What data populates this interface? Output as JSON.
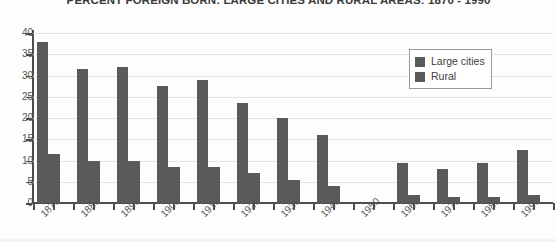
{
  "chart_data": {
    "type": "bar",
    "title": "PERCENT FOREIGN BORN: LARGE CITIES AND RURAL AREAS: 1870 - 1990",
    "xlabel": "",
    "ylabel": "",
    "ylim": [
      0,
      40
    ],
    "yticks": [
      0,
      5,
      10,
      15,
      20,
      25,
      30,
      35,
      40
    ],
    "ytick_labels": [
      "0",
      "5",
      "10",
      "15",
      "20",
      "25",
      "30",
      "35",
      "40"
    ],
    "grid": true,
    "legend_position": "upper-right",
    "categories": [
      "1870",
      "1880",
      "1890",
      "1900",
      "1910",
      "1920",
      "1930",
      "1940",
      "1950",
      "1960",
      "1970",
      "1980",
      "1990"
    ],
    "series": [
      {
        "name": "Large cities",
        "color": "#5a5a5a",
        "values": [
          38,
          31.5,
          32,
          27.5,
          29,
          23.5,
          20,
          16,
          null,
          9.5,
          8,
          9.5,
          12.5
        ]
      },
      {
        "name": "Rural",
        "color": "#5a5a5a",
        "values": [
          11.5,
          10,
          10,
          8.5,
          8.5,
          7,
          5.5,
          4,
          null,
          2,
          1.5,
          1.5,
          2
        ]
      }
    ]
  },
  "legend": {
    "items": [
      {
        "label": "Large cities",
        "color": "#5a5a5a"
      },
      {
        "label": "Rural",
        "color": "#5a5a5a"
      }
    ]
  },
  "colors": {
    "bar": "#5a5a5a",
    "axis": "#4d4d4d",
    "grid": "#e3e3e3",
    "text": "#555555",
    "background": "#fdfdfd"
  }
}
